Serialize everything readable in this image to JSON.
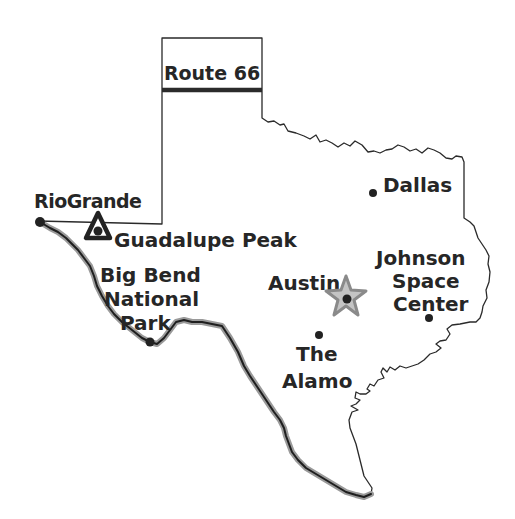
{
  "map": {
    "title": "Texas",
    "colors": {
      "outline": "#2a2a2a",
      "river_shadow": "#9a9a9a",
      "star_fill": "#c4c4c4",
      "star_stroke": "#8a8a8a",
      "text": "#262626"
    },
    "route_sign": {
      "label": "Route 66"
    },
    "labels": {
      "rio_grande": "RioGrande",
      "guadalupe_peak": "Guadalupe Peak",
      "big_bend_line1": "Big Bend",
      "big_bend_line2": "National",
      "big_bend_line3": "Park",
      "austin": "Austin",
      "alamo_line1": "The",
      "alamo_line2": "Alamo",
      "dallas": "Dallas",
      "johnson_line1": "Johnson",
      "johnson_line2": "Space",
      "johnson_line3": "Center"
    },
    "markers": [
      {
        "name": "Rio Grande",
        "icon": "dot-icon"
      },
      {
        "name": "Guadalupe Peak",
        "icon": "mountain-triangle-icon"
      },
      {
        "name": "Big Bend National Park",
        "icon": "dot-icon"
      },
      {
        "name": "Austin",
        "icon": "capital-star-icon"
      },
      {
        "name": "The Alamo",
        "icon": "dot-icon"
      },
      {
        "name": "Dallas",
        "icon": "dot-icon"
      },
      {
        "name": "Johnson Space Center",
        "icon": "dot-icon"
      }
    ]
  }
}
